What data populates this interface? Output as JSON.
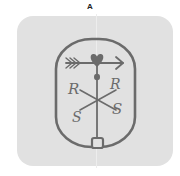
{
  "figure": {
    "label": "A",
    "panel_color": "#e1e1e1",
    "stroke_color": "#6b6b6b",
    "symbol": {
      "name": "weathervane-sigil",
      "letters": {
        "upper_left": "R",
        "upper_right": "R",
        "lower_left": "S",
        "lower_right": "S"
      },
      "elements": [
        "oval-border",
        "arrow",
        "heart",
        "dot",
        "staff",
        "cross",
        "base-square"
      ]
    }
  }
}
